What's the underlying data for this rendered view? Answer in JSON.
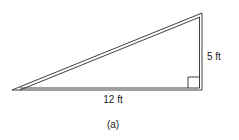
{
  "figure": {
    "caption": "(a)",
    "shape": "right-triangle",
    "labels": {
      "vertical_side": "5 ft",
      "horizontal_side": "12 ft"
    },
    "right_angle_marker": true,
    "colors": {
      "stroke": "#2a2a2a",
      "background": "#ffffff"
    }
  }
}
